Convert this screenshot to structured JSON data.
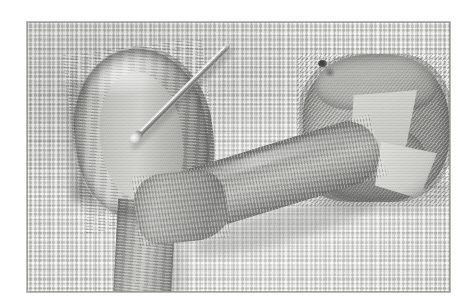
{
  "page": {
    "background_color": "#ffffff",
    "content_type": "photograph"
  },
  "photograph": {
    "title": "Ribbon embroidery in progress on evenweave cloth",
    "medium": "black-and-white photograph",
    "palette": {
      "cloth_base": "#e6e6e3",
      "cloth_thread_shadow": "#969692",
      "ribbon_light": "#d3d3cf",
      "ribbon_mid": "#a4a4a0",
      "ribbon_dark": "#787875",
      "needle_highlight": "#f2f2f0",
      "needle_shadow": "#6f6f6c",
      "plate_border": "#b9b9b6"
    },
    "frame": {
      "left": 27,
      "top": 22,
      "width": 423,
      "height": 270
    },
    "subjects": [
      {
        "name": "ground-cloth",
        "label": "Evenweave / aida ground fabric",
        "description": "Pale woven grid fabric filling the whole frame"
      },
      {
        "name": "ribbon-loop-left",
        "label": "Teardrop ribbon loop",
        "description": "Wide ribbon folded into an upright teardrop loop at left"
      },
      {
        "name": "ribbon-knot-centre",
        "label": "Gathered centre knot",
        "description": "Ribbon gathered and pinched at the centre of the work"
      },
      {
        "name": "ribbon-tail-left",
        "label": "Ribbon tail",
        "description": "Ribbon end running down and off the bottom edge"
      },
      {
        "name": "ribbon-band",
        "label": "Diagonal ribbon band",
        "description": "Ribbon sweeping diagonally from centre to the right"
      },
      {
        "name": "ribbon-roll-right",
        "label": "Rolled ribbon form",
        "description": "Ribbon twisted and rolled into a folded rosette at right"
      },
      {
        "name": "needle",
        "label": "Steel pin",
        "description": "Straight metal pin lying diagonally across the upper left"
      },
      {
        "name": "pin-hole",
        "label": "Pin entry point",
        "description": "Small dark puncture at the top of the rolled ribbon"
      }
    ]
  }
}
